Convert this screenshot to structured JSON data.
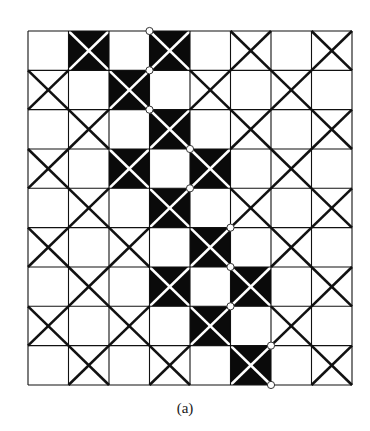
{
  "figure": {
    "caption": "(a)",
    "grid": {
      "columns": 8,
      "rows": 9,
      "origin_x": 28,
      "origin_y": 31,
      "cell_w": 40.5,
      "cell_h": 39.33,
      "legend": {
        "E": "empty cell",
        "X": "cell with black diagonal cross",
        "B": "black cell with white diagonal cross"
      },
      "cells": [
        [
          "E",
          "B",
          "E",
          "B",
          "E",
          "X",
          "E",
          "X"
        ],
        [
          "X",
          "E",
          "B",
          "E",
          "X",
          "E",
          "X",
          "E"
        ],
        [
          "E",
          "X",
          "E",
          "B",
          "E",
          "X",
          "E",
          "X"
        ],
        [
          "X",
          "E",
          "B",
          "E",
          "B",
          "E",
          "X",
          "E"
        ],
        [
          "E",
          "X",
          "E",
          "B",
          "E",
          "X",
          "E",
          "X"
        ],
        [
          "X",
          "E",
          "X",
          "E",
          "B",
          "E",
          "X",
          "E"
        ],
        [
          "E",
          "X",
          "E",
          "B",
          "E",
          "B",
          "E",
          "X"
        ],
        [
          "X",
          "E",
          "X",
          "E",
          "B",
          "E",
          "X",
          "E"
        ],
        [
          "E",
          "X",
          "E",
          "X",
          "E",
          "B",
          "E",
          "X"
        ]
      ]
    },
    "markers": [
      {
        "col_line": 3,
        "row_line": 0
      },
      {
        "col_line": 3,
        "row_line": 1
      },
      {
        "col_line": 3,
        "row_line": 2
      },
      {
        "col_line": 4,
        "row_line": 3
      },
      {
        "col_line": 4,
        "row_line": 4
      },
      {
        "col_line": 5,
        "row_line": 5
      },
      {
        "col_line": 5,
        "row_line": 6
      },
      {
        "col_line": 5,
        "row_line": 7
      },
      {
        "col_line": 6,
        "row_line": 8
      },
      {
        "col_line": 6,
        "row_line": 9
      }
    ],
    "colors": {
      "line": "#111111",
      "fill": "#0a0a0a",
      "background": "#ffffff",
      "marker_fill": "#ffffff",
      "marker_stroke": "#333333"
    }
  }
}
